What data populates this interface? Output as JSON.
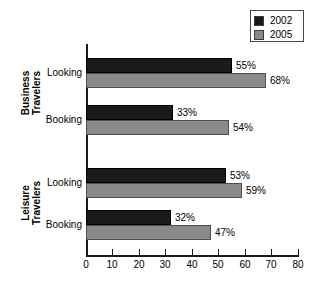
{
  "chart_data": {
    "type": "bar",
    "orientation": "horizontal",
    "title": "",
    "xlabel": "",
    "ylabel": "",
    "xlim": [
      0,
      80
    ],
    "xticks": [
      0,
      10,
      20,
      30,
      40,
      50,
      60,
      70,
      80
    ],
    "grid": false,
    "legend_position": "top-right",
    "series": [
      {
        "name": "2002",
        "color": "#1a1a1a",
        "values": [
          55,
          33,
          53,
          32
        ]
      },
      {
        "name": "2005",
        "color": "#8a8a8a",
        "values": [
          68,
          54,
          59,
          47
        ]
      }
    ],
    "categories": [
      "Looking",
      "Booking",
      "Looking",
      "Booking"
    ],
    "groups": [
      {
        "name": "Business Travelers",
        "categories": [
          "Looking",
          "Booking"
        ]
      },
      {
        "name": "Leisure Travelers",
        "categories": [
          "Looking",
          "Booking"
        ]
      }
    ],
    "data_labels": [
      "55%",
      "68%",
      "33%",
      "54%",
      "53%",
      "59%",
      "32%",
      "47%"
    ]
  },
  "legend": {
    "items": [
      {
        "label": "2002",
        "color": "#1a1a1a"
      },
      {
        "label": "2005",
        "color": "#8a8a8a"
      }
    ]
  },
  "axis": {
    "x_tick_labels": [
      "0",
      "10",
      "20",
      "30",
      "40",
      "50",
      "60",
      "70",
      "80"
    ]
  },
  "groups": [
    {
      "line1": "Business",
      "line2": "Travelers",
      "rows": [
        {
          "label": "Looking",
          "bars": [
            {
              "series": "2002",
              "value": 55,
              "label": "55%"
            },
            {
              "series": "2005",
              "value": 68,
              "label": "68%"
            }
          ]
        },
        {
          "label": "Booking",
          "bars": [
            {
              "series": "2002",
              "value": 33,
              "label": "33%"
            },
            {
              "series": "2005",
              "value": 54,
              "label": "54%"
            }
          ]
        }
      ]
    },
    {
      "line1": "Leisure",
      "line2": "Travelers",
      "rows": [
        {
          "label": "Looking",
          "bars": [
            {
              "series": "2002",
              "value": 53,
              "label": "53%"
            },
            {
              "series": "2005",
              "value": 59,
              "label": "59%"
            }
          ]
        },
        {
          "label": "Booking",
          "bars": [
            {
              "series": "2002",
              "value": 32,
              "label": "32%"
            },
            {
              "series": "2005",
              "value": 47,
              "label": "47%"
            }
          ]
        }
      ]
    }
  ]
}
